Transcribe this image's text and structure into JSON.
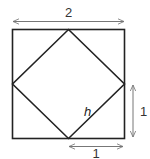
{
  "diagram": {
    "colors": {
      "stroke": "#222222",
      "arrow": "#777777",
      "text": "#333333"
    },
    "labels": {
      "top_dimension": "2",
      "right_dimension": "1",
      "bottom_dimension": "1",
      "hypotenuse": "h"
    }
  }
}
